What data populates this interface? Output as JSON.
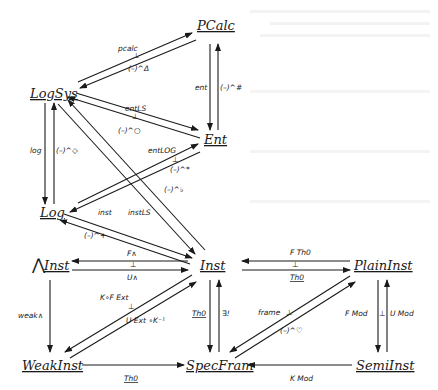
{
  "diagram": {
    "type": "commutative-diagram",
    "nodes": {
      "pcalc": "PCalc",
      "logsys": "LogSys",
      "ent": "Ent",
      "log": "Log",
      "and_inst_prefix": "⋀",
      "and_inst": "Inst",
      "inst": "Inst",
      "plaininst": "PlainInst",
      "weakinst": "WeakInst",
      "specfram": "SpecFram",
      "semiinst": "SemiInst"
    },
    "labels": {
      "pcalc": "pcalc",
      "delta": "(–)^Δ",
      "ent": "ent",
      "sharp": "(–)^#",
      "ent_ls": "entLS",
      "circ": "(–)^○",
      "log": "log",
      "diamond": "(–)^◇",
      "ent_log": "entLOG",
      "star": "(–)^*",
      "flat": "(–)^♭",
      "inst": "inst",
      "inst_ls": "instLS",
      "plus": "(–)^+",
      "f_and": "F∧",
      "u_and": "U∧",
      "weak_and": "weak∧",
      "k_f_ext": "K∘F Ext",
      "u_ext_k": "U Ext ∘K⁻¹",
      "th0_left": "Th0",
      "exists_unique": "∃!",
      "f_th0": "F Th0",
      "th0_top": "Th0",
      "frame": "frame",
      "heart": "(–)^♡",
      "f_mod": "F Mod",
      "u_mod": "U Mod",
      "k_mod": "K Mod",
      "th0_bottom": "Th0",
      "adjoint": "⊥"
    }
  }
}
